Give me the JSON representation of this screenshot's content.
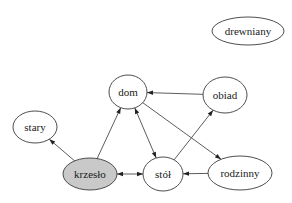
{
  "graph": {
    "type": "directed",
    "nodes": [
      {
        "id": "drewniany",
        "label": "drewniany",
        "highlighted": false
      },
      {
        "id": "dom",
        "label": "dom",
        "highlighted": false
      },
      {
        "id": "obiad",
        "label": "obiad",
        "highlighted": false
      },
      {
        "id": "stary",
        "label": "stary",
        "highlighted": false
      },
      {
        "id": "krzeslo",
        "label": "krzesło",
        "highlighted": true
      },
      {
        "id": "stol",
        "label": "stół",
        "highlighted": false
      },
      {
        "id": "rodzinny",
        "label": "rodzinny",
        "highlighted": false
      }
    ],
    "edges": [
      {
        "from": "obiad",
        "to": "dom",
        "bidirectional": false
      },
      {
        "from": "dom",
        "to": "rodzinny",
        "bidirectional": false
      },
      {
        "from": "krzeslo",
        "to": "dom",
        "bidirectional": false
      },
      {
        "from": "krzeslo",
        "to": "stary",
        "bidirectional": false
      },
      {
        "from": "dom",
        "to": "stol",
        "bidirectional": true
      },
      {
        "from": "stol",
        "to": "obiad",
        "bidirectional": false
      },
      {
        "from": "rodzinny",
        "to": "stol",
        "bidirectional": false
      },
      {
        "from": "krzeslo",
        "to": "stol",
        "bidirectional": true
      }
    ]
  },
  "colors": {
    "highlight_fill": "#c9c9c9",
    "default_fill": "#ffffff",
    "stroke": "#3a3a3a"
  }
}
